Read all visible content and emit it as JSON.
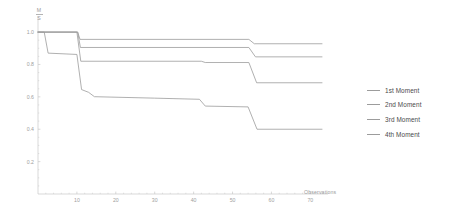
{
  "chart_data": {
    "type": "line",
    "title": "",
    "subtitle": "",
    "xlabel": "Observations",
    "ylabel_numerator": "M",
    "ylabel_denominator": "S",
    "xlim": [
      0,
      73
    ],
    "ylim": [
      0,
      1.05
    ],
    "xticks": [
      10,
      20,
      30,
      40,
      50,
      60,
      70
    ],
    "xtick_labels": [
      "10",
      "20",
      "30",
      "40",
      "50",
      "60",
      "70"
    ],
    "yticks": [
      0.2,
      0.4,
      0.6,
      0.8,
      1.0
    ],
    "ytick_labels": [
      "0.2",
      "0.4",
      "0.6",
      "0.8",
      "1.0"
    ],
    "grid": false,
    "legend_position": "right",
    "line_color": "#9c9c9c",
    "axis_color": "#c9c9c9",
    "tick_label_color": "#a0a0a0",
    "series": [
      {
        "name": "1st Moment",
        "color": "#9c9c9c",
        "x": [
          0,
          10.2,
          10.8,
          54.2,
          55.6,
          73
        ],
        "values": [
          1.0,
          1.0,
          0.955,
          0.955,
          0.928,
          0.928
        ]
      },
      {
        "name": "2nd Moment",
        "color": "#9c9c9c",
        "x": [
          0,
          10.2,
          10.9,
          54.2,
          55.9,
          73
        ],
        "values": [
          1.0,
          1.0,
          0.905,
          0.905,
          0.847,
          0.847
        ]
      },
      {
        "name": "3rd Moment",
        "color": "#9c9c9c",
        "x": [
          0,
          10.0,
          11.0,
          42.0,
          43.0,
          54.2,
          56.2,
          73
        ],
        "values": [
          1.0,
          1.0,
          0.82,
          0.82,
          0.812,
          0.812,
          0.687,
          0.687
        ]
      },
      {
        "name": "4th Moment",
        "color": "#9c9c9c",
        "x": [
          0,
          1.6,
          2.6,
          10.0,
          11.2,
          13.0,
          14.5,
          30.0,
          41.5,
          43.0,
          54.0,
          56.3,
          73
        ],
        "values": [
          1.0,
          1.0,
          0.87,
          0.862,
          0.645,
          0.628,
          0.601,
          0.592,
          0.585,
          0.543,
          0.538,
          0.4,
          0.4
        ]
      }
    ]
  },
  "legend": {
    "items": [
      {
        "label": "1st Moment"
      },
      {
        "label": "2nd Moment"
      },
      {
        "label": "3rd Moment"
      },
      {
        "label": "4th Moment"
      }
    ]
  }
}
